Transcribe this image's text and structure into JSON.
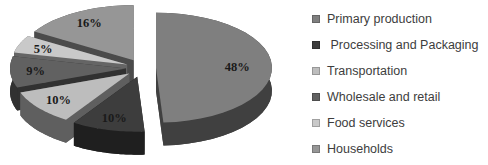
{
  "chart_data": {
    "type": "pie",
    "style": "3d-exploded-pie",
    "title": "",
    "legend_position": "right",
    "background": "#ffffff",
    "label_color": "#1a1a1a",
    "legend_text_color": "#3d3d3d",
    "slices": [
      {
        "label": "Primary production",
        "value": 48,
        "display": "48%",
        "color": "#7f7f7f"
      },
      {
        "label": " Processing and Packaging",
        "value": 10,
        "display": "10%",
        "color": "#3d3d3d"
      },
      {
        "label": "Transportation",
        "value": 10,
        "display": "10%",
        "color": "#bdbdbd"
      },
      {
        "label": "Wholesale and retail",
        "value": 9,
        "display": "9%",
        "color": "#616161"
      },
      {
        "label": "Food services",
        "value": 5,
        "display": "5%",
        "color": "#c9c9c9"
      },
      {
        "label": "Households",
        "value": 16,
        "display": "16%",
        "color": "#969696"
      }
    ]
  }
}
